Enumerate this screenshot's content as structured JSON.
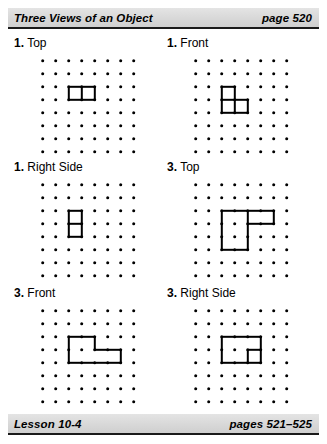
{
  "header": {
    "title": "Three Views of an Object",
    "page_ref": "page 520"
  },
  "footer": {
    "lesson": "Lesson 10-4",
    "page_ref": "pages 521–525"
  },
  "grid": {
    "columns": 8,
    "rows": 8,
    "spacing_px": 13
  },
  "panels": [
    {
      "number": "1.",
      "label": "Top",
      "segments": [
        {
          "dir": "h",
          "col": 2,
          "row": 2,
          "len": 2
        },
        {
          "dir": "h",
          "col": 2,
          "row": 3,
          "len": 2
        },
        {
          "dir": "v",
          "col": 2,
          "row": 2,
          "len": 1
        },
        {
          "dir": "v",
          "col": 3,
          "row": 2,
          "len": 1
        },
        {
          "dir": "v",
          "col": 4,
          "row": 2,
          "len": 1
        }
      ]
    },
    {
      "number": "1.",
      "label": "Front",
      "segments": [
        {
          "dir": "h",
          "col": 2,
          "row": 2,
          "len": 1
        },
        {
          "dir": "h",
          "col": 3,
          "row": 3,
          "len": 1
        },
        {
          "dir": "h",
          "col": 2,
          "row": 3,
          "len": 1
        },
        {
          "dir": "h",
          "col": 2,
          "row": 4,
          "len": 2
        },
        {
          "dir": "v",
          "col": 2,
          "row": 2,
          "len": 2
        },
        {
          "dir": "v",
          "col": 3,
          "row": 2,
          "len": 1
        },
        {
          "dir": "v",
          "col": 3,
          "row": 3,
          "len": 1
        },
        {
          "dir": "v",
          "col": 4,
          "row": 3,
          "len": 1
        }
      ]
    },
    {
      "number": "1.",
      "label": "Right Side",
      "segments": [
        {
          "dir": "h",
          "col": 2,
          "row": 2,
          "len": 1
        },
        {
          "dir": "h",
          "col": 2,
          "row": 3,
          "len": 1
        },
        {
          "dir": "h",
          "col": 2,
          "row": 4,
          "len": 1
        },
        {
          "dir": "v",
          "col": 2,
          "row": 2,
          "len": 2
        },
        {
          "dir": "v",
          "col": 3,
          "row": 2,
          "len": 2
        }
      ]
    },
    {
      "number": "3.",
      "label": "Top",
      "segments": [
        {
          "dir": "h",
          "col": 2,
          "row": 2,
          "len": 4
        },
        {
          "dir": "h",
          "col": 4,
          "row": 3,
          "len": 2
        },
        {
          "dir": "h",
          "col": 2,
          "row": 5,
          "len": 2
        },
        {
          "dir": "v",
          "col": 2,
          "row": 2,
          "len": 3
        },
        {
          "dir": "v",
          "col": 4,
          "row": 2,
          "len": 3
        },
        {
          "dir": "v",
          "col": 6,
          "row": 2,
          "len": 1
        }
      ]
    },
    {
      "number": "3.",
      "label": "Front",
      "segments": [
        {
          "dir": "h",
          "col": 2,
          "row": 2,
          "len": 2
        },
        {
          "dir": "h",
          "col": 4,
          "row": 3,
          "len": 2
        },
        {
          "dir": "h",
          "col": 2,
          "row": 4,
          "len": 4
        },
        {
          "dir": "v",
          "col": 2,
          "row": 2,
          "len": 2
        },
        {
          "dir": "v",
          "col": 4,
          "row": 2,
          "len": 1
        },
        {
          "dir": "v",
          "col": 6,
          "row": 3,
          "len": 1
        }
      ]
    },
    {
      "number": "3.",
      "label": "Right Side",
      "segments": [
        {
          "dir": "h",
          "col": 2,
          "row": 2,
          "len": 3
        },
        {
          "dir": "h",
          "col": 4,
          "row": 3,
          "len": 1
        },
        {
          "dir": "h",
          "col": 2,
          "row": 4,
          "len": 3
        },
        {
          "dir": "v",
          "col": 2,
          "row": 2,
          "len": 2
        },
        {
          "dir": "v",
          "col": 4,
          "row": 3,
          "len": 1
        },
        {
          "dir": "v",
          "col": 5,
          "row": 2,
          "len": 2
        }
      ]
    }
  ]
}
